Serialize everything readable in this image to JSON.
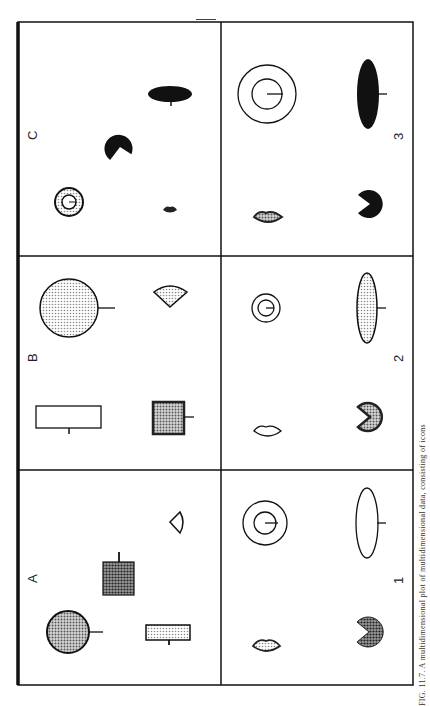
{
  "figure": {
    "caption": "FIG. 11.7. A multidimensional plot of multidimensional data, consisting of icons",
    "orientation": "rotated-90-landscape",
    "grid": {
      "rows": 3,
      "columns": 2
    },
    "panels": [
      {
        "id": "C",
        "label": "C",
        "column": "left",
        "row": "top",
        "icons": [
          "dotted-ring-with-circle",
          "black-pacman",
          "small-dark-lips",
          "black-horizontal-ellipse-with-stem"
        ]
      },
      {
        "id": "3",
        "label": "3",
        "column": "right",
        "row": "top",
        "icons": [
          "concentric-circles-with-tick",
          "black-vertical-ellipse-with-tick",
          "dotted-lips",
          "black-pacman"
        ]
      },
      {
        "id": "B",
        "label": "B",
        "column": "left",
        "row": "middle",
        "icons": [
          "large-dotted-circle-with-tick",
          "dotted-fan",
          "white-rectangle-with-tick",
          "dark-dotted-square-with-tick"
        ]
      },
      {
        "id": "2",
        "label": "2",
        "column": "right",
        "row": "middle",
        "icons": [
          "small-concentric-circles-with-tick",
          "dotted-vertical-ellipse-with-tick",
          "open-lips",
          "dotted-pacman"
        ]
      },
      {
        "id": "A",
        "label": "A",
        "column": "left",
        "row": "bottom",
        "icons": [
          "open-fan",
          "dark-dotted-square-with-tick",
          "dotted-circle-with-tick",
          "light-dotted-rectangle-with-tick"
        ]
      },
      {
        "id": "1",
        "label": "1",
        "column": "right",
        "row": "bottom",
        "icons": [
          "concentric-circles-with-tick",
          "open-vertical-ellipse-with-tick",
          "dotted-lips",
          "dark-dotted-pacman"
        ]
      }
    ]
  },
  "colors": {
    "ink": "#111111",
    "paper": "#ffffff",
    "light_dot": "#cfcfcf",
    "mid_dot": "#9a9a9a",
    "dark_dot": "#6a6a6a"
  }
}
